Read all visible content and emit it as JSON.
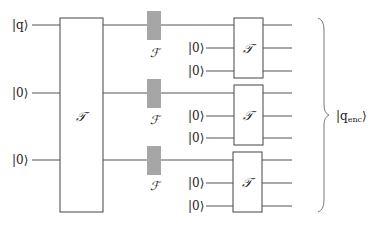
{
  "diagram": {
    "type": "quantum-circuit",
    "inputs": [
      {
        "label": "|q⟩",
        "y": 25
      },
      {
        "label": "|0⟩",
        "y": 93
      },
      {
        "label": "|0⟩",
        "y": 160
      }
    ],
    "encoder_gate": {
      "label": "𝒯",
      "x": 60,
      "y": 18,
      "w": 43,
      "h": 194
    },
    "fourier_gates": [
      {
        "label": "ℱ",
        "y": 25
      },
      {
        "label": "ℱ",
        "y": 93
      },
      {
        "label": "ℱ",
        "y": 160
      }
    ],
    "blocks": [
      {
        "gate_label": "𝒯",
        "ancilla_labels": [
          "|0⟩",
          "|0⟩"
        ],
        "wires_y": [
          25,
          48,
          71
        ],
        "box_y": 18
      },
      {
        "gate_label": "𝒯",
        "ancilla_labels": [
          "|0⟩",
          "|0⟩"
        ],
        "wires_y": [
          93,
          116,
          138
        ],
        "box_y": 85
      },
      {
        "gate_label": "𝒯",
        "ancilla_labels": [
          "|0⟩",
          "|0⟩"
        ],
        "wires_y": [
          160,
          183,
          206
        ],
        "box_y": 152
      }
    ],
    "output_label": "|q",
    "output_subscript": "enc",
    "output_close": "⟩",
    "colors": {
      "wire": "#555555",
      "fourier_fill": "#a6a6a6",
      "box_stroke": "#444444"
    }
  }
}
